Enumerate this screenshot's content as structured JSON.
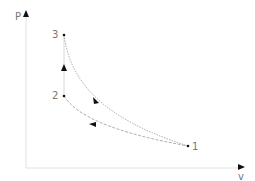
{
  "diagram": {
    "type": "p-v cycle diagram",
    "axes": {
      "y_label": "P",
      "x_label": "v"
    },
    "points": [
      {
        "id": "1",
        "label": "1"
      },
      {
        "id": "2",
        "label": "2"
      },
      {
        "id": "3",
        "label": "3"
      }
    ],
    "processes": [
      {
        "from": "1",
        "to": "2",
        "style": "dashed curve"
      },
      {
        "from": "2",
        "to": "3",
        "style": "vertical line"
      },
      {
        "from": "3",
        "to": "1",
        "style": "dotted curve"
      }
    ],
    "colors": {
      "axis": "#e2e2e2",
      "curve": "#9a9a9a",
      "arrow": "#111111",
      "label": "#777777"
    }
  }
}
